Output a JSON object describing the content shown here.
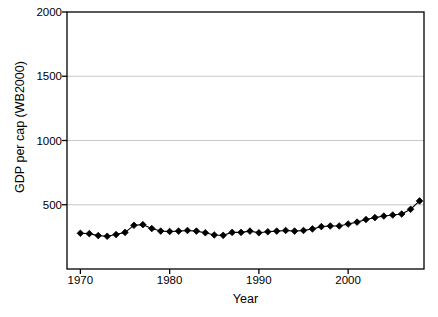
{
  "chart_data": {
    "type": "line",
    "title": "",
    "xlabel": "Year",
    "ylabel": "GDP per cap (WB2000)",
    "xlim": [
      1968.5,
      2008.5
    ],
    "ylim": [
      0,
      2000
    ],
    "xticks": [
      1970,
      1980,
      1990,
      2000
    ],
    "yticks": [
      500,
      1000,
      1500,
      2000
    ],
    "grid": "horizontal",
    "legend": "none",
    "marker": "filled-diamond",
    "line_color": "#000000",
    "marker_color": "#000000",
    "grid_color": "#c8c8c8",
    "axis_color": "#000000",
    "background": "#ffffff",
    "series": [
      {
        "name": "GDP per cap (WB2000)",
        "x": [
          1970,
          1971,
          1972,
          1973,
          1974,
          1975,
          1976,
          1977,
          1978,
          1979,
          1980,
          1981,
          1982,
          1983,
          1984,
          1985,
          1986,
          1987,
          1988,
          1989,
          1990,
          1991,
          1992,
          1993,
          1994,
          1995,
          1996,
          1997,
          1998,
          1999,
          2000,
          2001,
          2002,
          2003,
          2004,
          2005,
          2006,
          2007,
          2008
        ],
        "values": [
          278,
          275,
          260,
          255,
          268,
          285,
          340,
          345,
          315,
          295,
          292,
          295,
          300,
          295,
          282,
          265,
          262,
          285,
          285,
          295,
          282,
          290,
          295,
          300,
          295,
          300,
          312,
          330,
          335,
          335,
          350,
          365,
          385,
          400,
          412,
          420,
          428,
          465,
          530
        ]
      }
    ]
  },
  "axis_text": {
    "yticks": [
      "2000",
      "1500",
      "1000",
      "500"
    ],
    "xticks": [
      "1970",
      "1980",
      "1990",
      "2000"
    ],
    "ylabel": "GDP per cap (WB2000)",
    "xlabel": "Year"
  }
}
